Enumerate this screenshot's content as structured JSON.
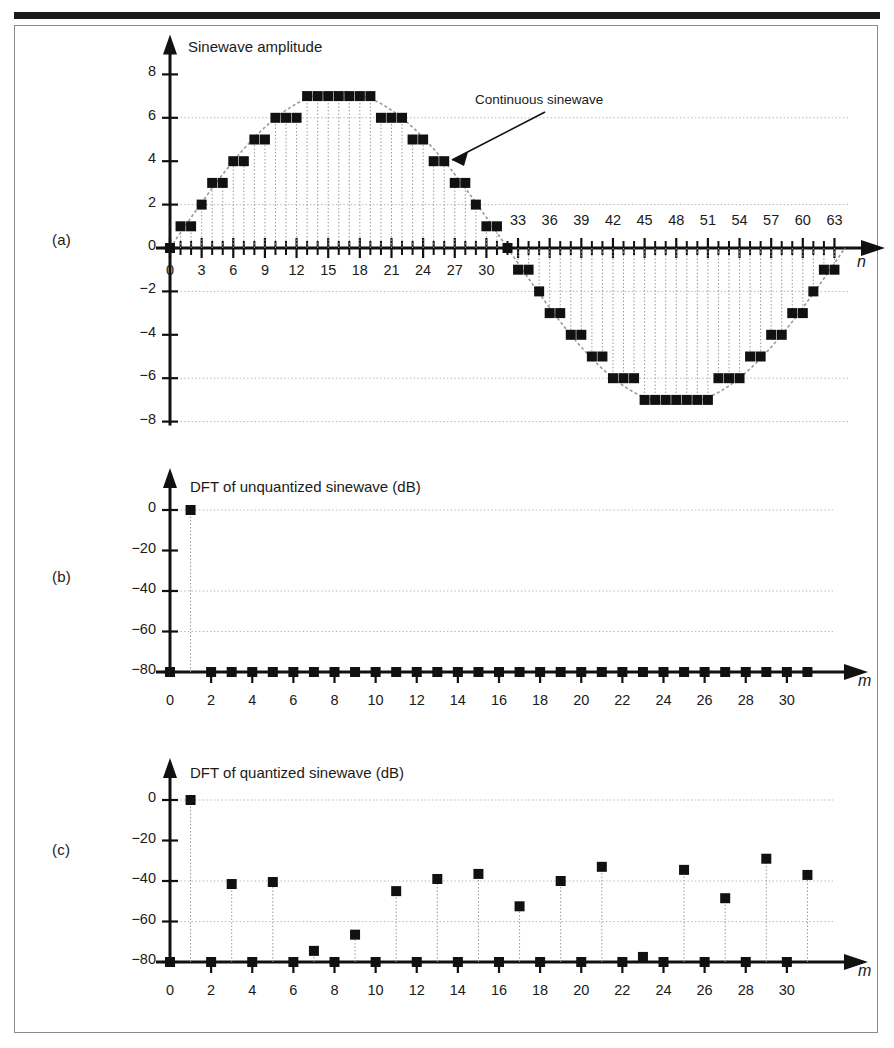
{
  "figure": {
    "panel_a_label": "(a)",
    "panel_b_label": "(b)",
    "panel_c_label": "(c)"
  },
  "chart_data": [
    {
      "type": "scatter",
      "panel": "(a)",
      "title": "Sinewave amplitude",
      "xlabel": "n",
      "ylabel": "",
      "xlim": [
        0,
        64
      ],
      "ylim": [
        -8,
        8
      ],
      "grid": true,
      "annotation": "Continuous sinewave",
      "annotation_target_x": 24,
      "annotation_target_y": 5,
      "xticks_labeled": [
        0,
        3,
        6,
        9,
        12,
        15,
        18,
        21,
        24,
        27,
        30,
        33,
        36,
        39,
        42,
        45,
        48,
        51,
        54,
        57,
        60,
        63
      ],
      "yticks": [
        8,
        6,
        4,
        2,
        0,
        -2,
        -4,
        -6,
        -8
      ],
      "ytick_labels": [
        "8",
        "6",
        "4",
        "2",
        "0",
        "−2",
        "−4",
        "−6",
        "−8"
      ],
      "x": [
        0,
        1,
        2,
        3,
        4,
        5,
        6,
        7,
        8,
        9,
        10,
        11,
        12,
        13,
        14,
        15,
        16,
        17,
        18,
        19,
        20,
        21,
        22,
        23,
        24,
        25,
        26,
        27,
        28,
        29,
        30,
        31,
        32,
        33,
        34,
        35,
        36,
        37,
        38,
        39,
        40,
        41,
        42,
        43,
        44,
        45,
        46,
        47,
        48,
        49,
        50,
        51,
        52,
        53,
        54,
        55,
        56,
        57,
        58,
        59,
        60,
        61,
        62,
        63
      ],
      "values": [
        0,
        1,
        1,
        2,
        3,
        3,
        4,
        4,
        5,
        5,
        6,
        6,
        6,
        7,
        7,
        7,
        7,
        7,
        7,
        7,
        6,
        6,
        6,
        5,
        5,
        4,
        4,
        3,
        3,
        2,
        1,
        1,
        0,
        -1,
        -1,
        -2,
        -3,
        -3,
        -4,
        -4,
        -5,
        -5,
        -6,
        -6,
        -6,
        -7,
        -7,
        -7,
        -7,
        -7,
        -7,
        -7,
        -6,
        -6,
        -6,
        -5,
        -5,
        -4,
        -4,
        -3,
        -3,
        -2,
        -1,
        -1
      ],
      "continuous_curve": "sine of amplitude 7 over 64 samples"
    },
    {
      "type": "scatter",
      "panel": "(b)",
      "title": "DFT of unquantized sinewave (dB)",
      "xlabel": "m",
      "ylabel": "",
      "xlim": [
        0,
        32
      ],
      "ylim": [
        -80,
        5
      ],
      "grid": true,
      "xticks_labeled": [
        0,
        2,
        4,
        6,
        8,
        10,
        12,
        14,
        16,
        18,
        20,
        22,
        24,
        26,
        28,
        30
      ],
      "yticks": [
        0,
        -20,
        -40,
        -60,
        -80
      ],
      "ytick_labels": [
        "0",
        "−20",
        "−40",
        "−60",
        "−80"
      ],
      "x": [
        0,
        1,
        2,
        3,
        4,
        5,
        6,
        7,
        8,
        9,
        10,
        11,
        12,
        13,
        14,
        15,
        16,
        17,
        18,
        19,
        20,
        21,
        22,
        23,
        24,
        25,
        26,
        27,
        28,
        29,
        30,
        31
      ],
      "values": [
        -80,
        0,
        -80,
        -80,
        -80,
        -80,
        -80,
        -80,
        -80,
        -80,
        -80,
        -80,
        -80,
        -80,
        -80,
        -80,
        -80,
        -80,
        -80,
        -80,
        -80,
        -80,
        -80,
        -80,
        -80,
        -80,
        -80,
        -80,
        -80,
        -80,
        -80,
        -80
      ]
    },
    {
      "type": "scatter",
      "panel": "(c)",
      "title": "DFT of quantized sinewave (dB)",
      "xlabel": "m",
      "ylabel": "",
      "xlim": [
        0,
        32
      ],
      "ylim": [
        -80,
        5
      ],
      "grid": true,
      "xticks_labeled": [
        0,
        2,
        4,
        6,
        8,
        10,
        12,
        14,
        16,
        18,
        20,
        22,
        24,
        26,
        28,
        30
      ],
      "yticks": [
        0,
        -20,
        -40,
        -60,
        -80
      ],
      "ytick_labels": [
        "0",
        "−20",
        "−40",
        "−60",
        "−80"
      ],
      "x": [
        0,
        1,
        2,
        3,
        4,
        5,
        6,
        7,
        8,
        9,
        10,
        11,
        12,
        13,
        14,
        15,
        16,
        17,
        18,
        19,
        20,
        21,
        22,
        23,
        24,
        25,
        26,
        27,
        28,
        29,
        30,
        31
      ],
      "values": [
        -80,
        0,
        -80,
        -41.5,
        -80,
        -40.5,
        -80,
        -74.5,
        -80,
        -66.5,
        -80,
        -45,
        -80,
        -39,
        -80,
        -36.5,
        -80,
        -52.5,
        -80,
        -40,
        -80,
        -33,
        -80,
        -77.5,
        -80,
        -34.5,
        -80,
        -48.5,
        -80,
        -29,
        -80,
        -37
      ]
    }
  ]
}
